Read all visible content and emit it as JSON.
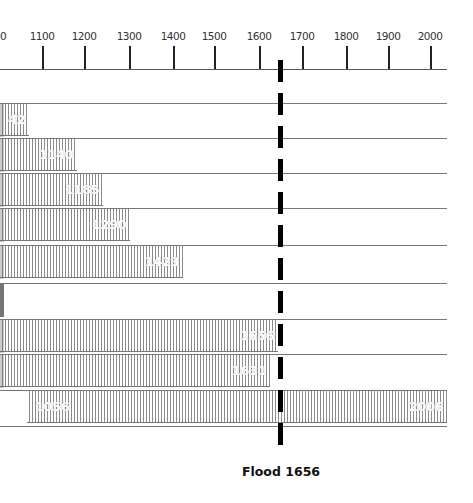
{
  "chart_data": {
    "type": "bar",
    "orientation": "horizontal-timeline",
    "title": "",
    "xlabel": "",
    "ylabel": "",
    "x_ticks": [
      1000,
      1100,
      1200,
      1300,
      1400,
      1500,
      1600,
      1700,
      1800,
      1900,
      2000
    ],
    "x_tick_labels": [
      "1000",
      "1100",
      "1200",
      "1300",
      "1400",
      "1500",
      "1600",
      "1700",
      "1800",
      "1900",
      "2000"
    ],
    "xlim": [
      1000,
      2030
    ],
    "grid": false,
    "legend": null,
    "bars": [
      {
        "row": 1,
        "start": 1000,
        "end": 1042,
        "label": "42"
      },
      {
        "row": 2,
        "start": 1000,
        "end": 1140,
        "label": "1140"
      },
      {
        "row": 3,
        "start": 1000,
        "end": 1185,
        "label": "1185"
      },
      {
        "row": 4,
        "start": 1000,
        "end": 1290,
        "label": "1290"
      },
      {
        "row": 5,
        "start": 1000,
        "end": 1423,
        "label": "1423"
      },
      {
        "row": 6,
        "start": 1000,
        "end": 1000,
        "label": ""
      },
      {
        "row": 7,
        "start": 1000,
        "end": 1656,
        "label": "1656"
      },
      {
        "row": 8,
        "start": 1000,
        "end": 1631,
        "label": "1631"
      },
      {
        "row": 9,
        "start": 1056,
        "end": 2006,
        "label_start": "1056",
        "label_end": "2006"
      }
    ],
    "annotations": [
      {
        "type": "vertical-dashed-line",
        "x": 1656,
        "label": "Flood 1656"
      }
    ]
  },
  "axis": {
    "ticks": [
      {
        "label": "00",
        "x": 0
      },
      {
        "label": "1100",
        "x": 42
      },
      {
        "label": "1200",
        "x": 84
      },
      {
        "label": "1300",
        "x": 129
      },
      {
        "label": "1400",
        "x": 173
      },
      {
        "label": "1500",
        "x": 214
      },
      {
        "label": "1600",
        "x": 259
      },
      {
        "label": "1700",
        "x": 302
      },
      {
        "label": "1800",
        "x": 346
      },
      {
        "label": "1900",
        "x": 388
      },
      {
        "label": "2000",
        "x": 430
      }
    ]
  },
  "rows": [
    {
      "top": 103,
      "left": 0,
      "width": 29,
      "label": "42",
      "align": "right"
    },
    {
      "top": 138,
      "left": 0,
      "width": 77,
      "label": "1140",
      "align": "right"
    },
    {
      "top": 173,
      "left": 0,
      "width": 103,
      "label": "1185",
      "align": "right"
    },
    {
      "top": 208,
      "left": 0,
      "width": 130,
      "label": "1290",
      "align": "right"
    },
    {
      "top": 245,
      "left": 0,
      "width": 183,
      "label": "1423",
      "align": "right"
    },
    {
      "top": 283,
      "left": 0,
      "width": 0,
      "label": "",
      "align": "right"
    },
    {
      "top": 319,
      "left": 0,
      "width": 278,
      "label": "1656",
      "align": "right"
    },
    {
      "top": 354,
      "left": 0,
      "width": 270,
      "label": "1631",
      "align": "right"
    },
    {
      "top": 390,
      "left": 27,
      "width": 420,
      "label_start": "1056",
      "label_end": "2006"
    }
  ],
  "flood": {
    "label": "Flood 1656",
    "color": "#000000"
  }
}
